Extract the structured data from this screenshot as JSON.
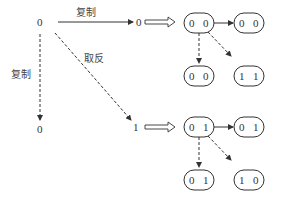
{
  "diagram": {
    "labels": {
      "copy_top": "复制",
      "copy_left": "复制",
      "invert": "取反"
    },
    "nodes": {
      "root": "0",
      "copied_right": "0",
      "copied_down": "0",
      "inverted": "1"
    },
    "top_group": {
      "main_pill": [
        "0",
        "0"
      ],
      "right_pill": [
        "0",
        "0"
      ],
      "down_pill": [
        "0",
        "0"
      ],
      "diag_pill": [
        "1",
        "1"
      ]
    },
    "bottom_group": {
      "main_pill": [
        "0",
        "1"
      ],
      "right_pill": [
        "0",
        "1"
      ],
      "down_pill": [
        "0",
        "1"
      ],
      "diag_pill": [
        "1",
        "0"
      ]
    }
  }
}
